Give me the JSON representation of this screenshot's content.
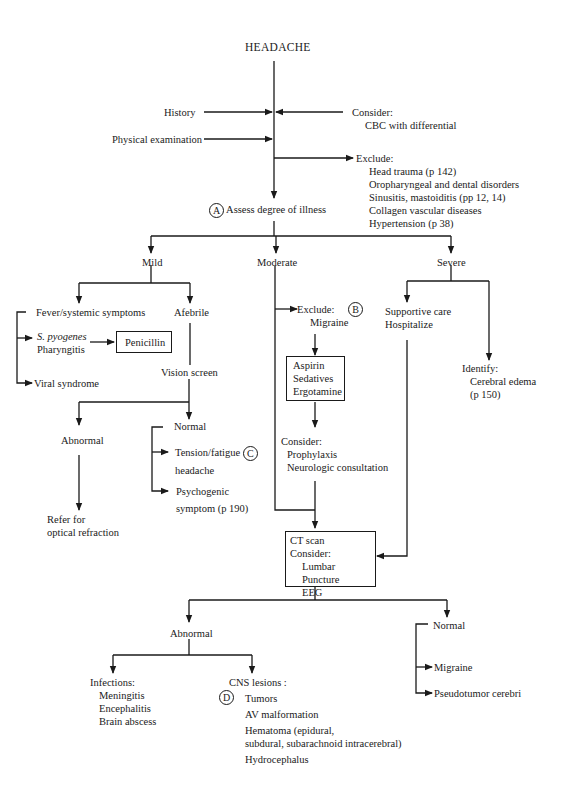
{
  "title": "HEADACHE",
  "top": {
    "history": "History",
    "physical_exam": "Physical examination",
    "consider_label": "Consider:",
    "consider_items": [
      "CBC with differential"
    ],
    "exclude_label": "Exclude:",
    "exclude_items": [
      "Head trauma (p 142)",
      "Oropharyngeal and dental disorders",
      "Sinusitis, mastoiditis (pp 12, 14)",
      "Collagen vascular diseases",
      "Hypertension (p 38)"
    ],
    "assess_marker": "A",
    "assess_label": "Assess degree of illness"
  },
  "severity": {
    "mild": "Mild",
    "moderate": "Moderate",
    "severe": "Severe"
  },
  "mild": {
    "fever": "Fever/systemic symptoms",
    "afebrile": "Afebrile",
    "strep_italic": "S. pyogenes",
    "strep_line2": "Pharyngitis",
    "penicillin": "Penicillin",
    "viral": "Viral syndrome",
    "vision": "Vision screen",
    "abnormal": "Abnormal",
    "refer_line1": "Refer for",
    "refer_line2": "optical refraction",
    "normal": "Normal",
    "tension_line1": "Tension/fatigue",
    "tension_line2": "headache",
    "tension_marker": "C",
    "psych_line1": "Psychogenic",
    "psych_line2": "symptom (p 190)"
  },
  "moderate": {
    "exclude_label": "Exclude:",
    "exclude_item": "Migraine",
    "marker": "B",
    "meds": [
      "Aspirin",
      "Sedatives",
      "Ergotamine"
    ],
    "consider_label": "Consider:",
    "consider_items": [
      "Prophylaxis",
      "Neurologic consultation"
    ]
  },
  "severe": {
    "supportive": "Supportive care",
    "hospitalize": "Hospitalize",
    "identify_label": "Identify:",
    "identify_item": "Cerebral edema",
    "identify_page": "(p 150)"
  },
  "ct": {
    "line1": "CT scan",
    "line2": "Consider:",
    "items": [
      "Lumbar Puncture",
      "EEG"
    ]
  },
  "ct_results": {
    "abnormal": "Abnormal",
    "normal": "Normal",
    "infections_label": "Infections:",
    "infections": [
      "Meningitis",
      "Encephalitis",
      "Brain abscess"
    ],
    "cns_label": "CNS lesions :",
    "cns_marker": "D",
    "cns_items": [
      "Tumors",
      "AV malformation",
      "Hematoma (epidural,",
      "subdural, subarachnoid intracerebral)",
      "Hydrocephalus"
    ],
    "normal_items": [
      "Migraine",
      "Pseudotumor cerebri"
    ]
  }
}
